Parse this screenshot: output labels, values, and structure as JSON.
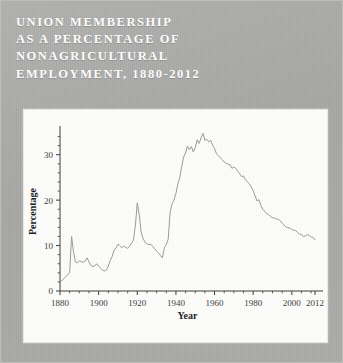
{
  "figure": {
    "title": "UNION MEMBERSHIP\nAS A PERCENTAGE OF\nNONAGRICULTURAL\nEMPLOYMENT, 1880-2012",
    "background_color": "#a9a9a7",
    "title_color": "#ffffff",
    "panel_color": "#fdfdfc"
  },
  "chart_data": {
    "type": "line",
    "title": "Union Membership as a Percentage of Nonagricultural Employment, 1880-2012",
    "xlabel": "Year",
    "ylabel": "Percentage",
    "xlim": [
      1880,
      2012
    ],
    "ylim": [
      0,
      35
    ],
    "grid": false,
    "legend": false,
    "line_color": "#9a9a98",
    "axis_color": "#3a3a38",
    "xticks": [
      1880,
      1900,
      1920,
      1940,
      1960,
      1980,
      2000,
      2012
    ],
    "xtick_labels": [
      "1880",
      "1900",
      "1920",
      "1940",
      "1960",
      "1980",
      "2000",
      "2012"
    ],
    "xminor_step": 5,
    "yticks": [
      0,
      10,
      20,
      30
    ],
    "ytick_labels": [
      "0",
      "10",
      "20",
      "30"
    ],
    "yminor_step": 2,
    "series": [
      {
        "name": "Union membership (% of nonagricultural employment)",
        "x": [
          1880,
          1881,
          1882,
          1883,
          1884,
          1885,
          1886,
          1887,
          1888,
          1889,
          1890,
          1891,
          1892,
          1893,
          1894,
          1895,
          1896,
          1897,
          1898,
          1899,
          1900,
          1901,
          1902,
          1903,
          1904,
          1905,
          1906,
          1907,
          1908,
          1909,
          1910,
          1911,
          1912,
          1913,
          1914,
          1915,
          1916,
          1917,
          1918,
          1919,
          1920,
          1921,
          1922,
          1923,
          1924,
          1925,
          1926,
          1927,
          1928,
          1929,
          1930,
          1931,
          1932,
          1933,
          1934,
          1935,
          1936,
          1937,
          1938,
          1939,
          1940,
          1941,
          1942,
          1943,
          1944,
          1945,
          1946,
          1947,
          1948,
          1949,
          1950,
          1951,
          1952,
          1953,
          1954,
          1955,
          1956,
          1957,
          1958,
          1959,
          1960,
          1961,
          1962,
          1963,
          1964,
          1965,
          1966,
          1967,
          1968,
          1969,
          1970,
          1971,
          1972,
          1973,
          1974,
          1975,
          1976,
          1977,
          1978,
          1979,
          1980,
          1981,
          1982,
          1983,
          1984,
          1985,
          1986,
          1987,
          1988,
          1989,
          1990,
          1991,
          1992,
          1993,
          1994,
          1995,
          1996,
          1997,
          1998,
          1999,
          2000,
          2001,
          2002,
          2003,
          2004,
          2005,
          2006,
          2007,
          2008,
          2009,
          2010,
          2011,
          2012
        ],
        "values": [
          2.0,
          2.3,
          2.7,
          3.2,
          3.6,
          4.0,
          12.0,
          8.6,
          6.4,
          6.2,
          6.6,
          6.5,
          6.3,
          6.6,
          7.3,
          6.4,
          5.6,
          5.4,
          5.5,
          6.0,
          5.5,
          5.0,
          4.6,
          4.4,
          4.6,
          5.5,
          6.7,
          7.6,
          9.0,
          9.5,
          10.3,
          10.0,
          9.5,
          9.9,
          9.6,
          9.4,
          9.8,
          10.5,
          11.2,
          14.3,
          19.4,
          16.8,
          13.0,
          11.5,
          10.8,
          10.4,
          10.2,
          10.3,
          9.8,
          9.3,
          8.8,
          8.4,
          7.8,
          7.3,
          9.5,
          10.2,
          11.4,
          17.3,
          19.2,
          20.0,
          21.5,
          23.5,
          25.0,
          27.4,
          29.5,
          30.4,
          31.9,
          31.1,
          31.8,
          30.6,
          31.5,
          33.3,
          32.5,
          33.7,
          34.7,
          33.2,
          33.4,
          32.8,
          33.2,
          32.1,
          31.4,
          30.2,
          29.8,
          29.3,
          28.9,
          28.4,
          28.1,
          27.9,
          27.8,
          27.0,
          27.3,
          27.0,
          26.4,
          25.8,
          25.2,
          25.3,
          24.5,
          24.0,
          23.6,
          22.9,
          22.1,
          20.9,
          19.8,
          20.1,
          18.8,
          18.0,
          17.5,
          17.0,
          16.8,
          16.4,
          16.1,
          16.1,
          15.8,
          15.8,
          15.5,
          14.9,
          14.5,
          14.1,
          13.9,
          13.9,
          13.5,
          13.4,
          13.3,
          12.9,
          12.5,
          12.5,
          12.0,
          12.1,
          12.4,
          12.3,
          11.9,
          11.8,
          11.3
        ]
      }
    ]
  }
}
